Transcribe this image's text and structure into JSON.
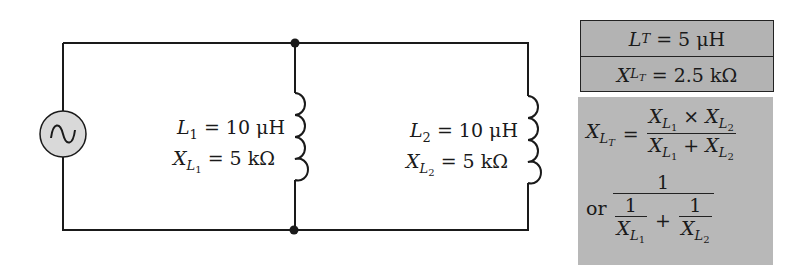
{
  "circuit": {
    "source": {
      "type": "AC voltage source",
      "symbol": "sine-wave"
    },
    "branches": [
      {
        "name": "L1",
        "inductance_label": "L",
        "inductance_sub": "1",
        "inductance_value": "= 10 μH",
        "reactance_label": "X",
        "reactance_sub": "L",
        "reactance_subsub": "1",
        "reactance_value": "= 5 kΩ"
      },
      {
        "name": "L2",
        "inductance_label": "L",
        "inductance_sub": "2",
        "inductance_value": "= 10 μH",
        "reactance_label": "X",
        "reactance_sub": "L",
        "reactance_subsub": "2",
        "reactance_value": "= 5 kΩ"
      }
    ]
  },
  "summary_box": {
    "total_inductance": {
      "label": "L",
      "sub": "T",
      "value": "= 5 μH"
    },
    "total_reactance": {
      "label": "X",
      "sub": "L",
      "subsub": "T",
      "value": "= 2.5 kΩ"
    }
  },
  "formula_box": {
    "lhs": {
      "label": "X",
      "sub": "L",
      "subsub": "T",
      "equals": "="
    },
    "product": {
      "x": "X",
      "sub": "L",
      "s1": "1",
      "s2": "2",
      "times": "×",
      "plus": "+"
    },
    "or_label": "or",
    "one": "1",
    "plus": "+"
  },
  "colors": {
    "box_fill": "#b3b3b3",
    "wire": "#1a1a1a",
    "source_fill": "#d9d9d9"
  }
}
